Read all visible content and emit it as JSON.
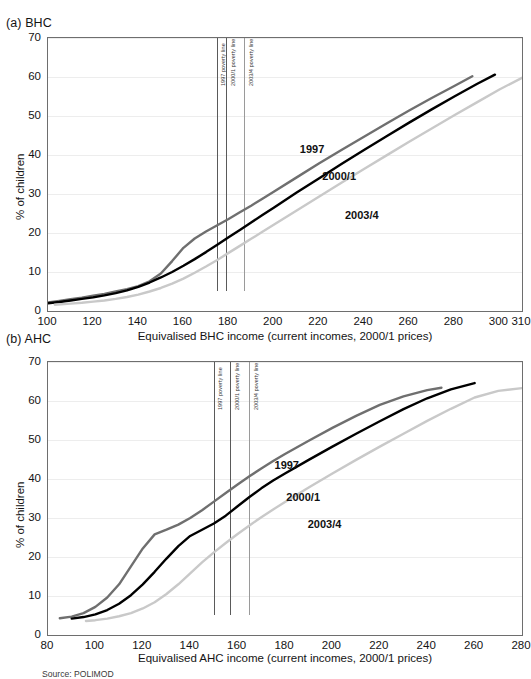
{
  "source_note": "Source: POLIMOD",
  "colors": {
    "s1997": "#6f6f6f",
    "s2000_1": "#000000",
    "s2003_4": "#c9c9c9",
    "frame": "#6e6e6e",
    "grid": "#ededed",
    "poverty_line": "#9a9a9a",
    "poverty_line_strong": "#5a5a5a"
  },
  "panels": [
    {
      "id": "bhc",
      "title": "(a) BHC",
      "chart_data": {
        "type": "line",
        "title": "(a) BHC",
        "xlabel": "Equivalised BHC income (current incomes, 2000/1 prices)",
        "ylabel": "% of children",
        "xlim": [
          100,
          310
        ],
        "ylim": [
          0,
          70
        ],
        "xticks": [
          100,
          120,
          140,
          160,
          180,
          200,
          220,
          240,
          260,
          280,
          300,
          310
        ],
        "yticks": [
          0,
          10,
          20,
          30,
          40,
          50,
          60,
          70
        ],
        "grid": true,
        "legend_position": "inline-annotations",
        "annotations": [
          {
            "text": "1997 poverty line",
            "x": 175,
            "orientation": "vertical"
          },
          {
            "text": "2000/1 poverty line",
            "x": 179,
            "orientation": "vertical"
          },
          {
            "text": "2003/4 poverty line",
            "x": 187,
            "orientation": "vertical"
          }
        ],
        "vlines": [
          175,
          179,
          187
        ],
        "series": [
          {
            "name": "1997",
            "color": "#6f6f6f",
            "label_x": 212,
            "label_y": 41,
            "x": [
              100,
              105,
              110,
              115,
              120,
              125,
              130,
              135,
              140,
              145,
              150,
              155,
              160,
              165,
              170,
              175,
              180,
              185,
              190,
              195,
              200,
              210,
              220,
              230,
              240,
              250,
              260,
              270,
              280,
              288
            ],
            "values": [
              2.2,
              2.6,
              3.0,
              3.4,
              3.9,
              4.4,
              5.0,
              5.6,
              6.4,
              7.6,
              9.6,
              12.8,
              16.2,
              18.6,
              20.4,
              22.0,
              23.6,
              25.3,
              27.0,
              28.8,
              30.6,
              34.2,
              37.8,
              41.3,
              44.7,
              48.1,
              51.4,
              54.6,
              57.7,
              60.2
            ]
          },
          {
            "name": "2000/1",
            "color": "#000000",
            "label_x": 222,
            "label_y": 34,
            "x": [
              100,
              105,
              110,
              115,
              120,
              125,
              130,
              135,
              140,
              145,
              150,
              155,
              160,
              165,
              170,
              175,
              180,
              185,
              190,
              195,
              200,
              210,
              220,
              230,
              240,
              250,
              260,
              270,
              280,
              290,
              298
            ],
            "values": [
              2.0,
              2.3,
              2.7,
              3.1,
              3.5,
              4.0,
              4.6,
              5.3,
              6.2,
              7.3,
              8.6,
              10.0,
              11.6,
              13.3,
              15.1,
              17.0,
              18.9,
              20.8,
              22.7,
              24.6,
              26.5,
              30.3,
              34.0,
              37.7,
              41.3,
              44.8,
              48.3,
              51.7,
              55.0,
              58.2,
              60.6
            ]
          },
          {
            "name": "2003/4",
            "color": "#c9c9c9",
            "label_x": 232,
            "label_y": 24,
            "x": [
              103,
              110,
              115,
              120,
              125,
              130,
              135,
              140,
              145,
              150,
              155,
              160,
              165,
              170,
              175,
              180,
              185,
              190,
              195,
              200,
              210,
              220,
              230,
              240,
              250,
              260,
              270,
              280,
              290,
              300,
              310
            ],
            "values": [
              1.6,
              1.9,
              2.1,
              2.4,
              2.7,
              3.1,
              3.6,
              4.2,
              5.0,
              5.9,
              7.0,
              8.3,
              9.8,
              11.4,
              13.1,
              14.9,
              16.7,
              18.5,
              20.3,
              22.1,
              25.7,
              29.3,
              32.9,
              36.4,
              39.9,
              43.4,
              46.8,
              50.2,
              53.5,
              56.8,
              59.8
            ]
          }
        ]
      }
    },
    {
      "id": "ahc",
      "title": "(b) AHC",
      "chart_data": {
        "type": "line",
        "title": "(b) AHC",
        "xlabel": "Equivalised AHC income (current incomes, 2000/1 prices)",
        "ylabel": "% of children",
        "xlim": [
          80,
          280
        ],
        "ylim": [
          0,
          70
        ],
        "xticks": [
          80,
          100,
          120,
          140,
          160,
          180,
          200,
          220,
          240,
          260,
          280
        ],
        "yticks": [
          0,
          10,
          20,
          30,
          40,
          50,
          60,
          70
        ],
        "grid": true,
        "legend_position": "inline-annotations",
        "annotations": [
          {
            "text": "1997 poverty line",
            "x": 150,
            "orientation": "vertical"
          },
          {
            "text": "2000/1 poverty line",
            "x": 157,
            "orientation": "vertical"
          },
          {
            "text": "2003/4 poverty line",
            "x": 165,
            "orientation": "vertical"
          }
        ],
        "vlines": [
          150,
          157,
          165
        ],
        "series": [
          {
            "name": "1997",
            "color": "#6f6f6f",
            "label_x": 176,
            "label_y": 43,
            "x": [
              85,
              90,
              95,
              100,
              105,
              110,
              115,
              120,
              125,
              130,
              135,
              140,
              145,
              150,
              155,
              160,
              165,
              170,
              175,
              180,
              190,
              200,
              210,
              220,
              230,
              240,
              246
            ],
            "values": [
              4.3,
              4.7,
              5.6,
              7.2,
              9.6,
              13.0,
              17.6,
              22.2,
              25.8,
              27.0,
              28.3,
              30.0,
              32.0,
              34.2,
              36.4,
              38.6,
              40.7,
              42.7,
              44.6,
              46.4,
              49.8,
              53.1,
              56.2,
              59.0,
              61.2,
              62.8,
              63.4
            ]
          },
          {
            "name": "2000/1",
            "color": "#000000",
            "label_x": 181,
            "label_y": 35,
            "x": [
              90,
              95,
              100,
              105,
              110,
              115,
              120,
              125,
              130,
              135,
              140,
              145,
              150,
              155,
              160,
              165,
              170,
              175,
              180,
              190,
              200,
              210,
              220,
              230,
              240,
              250,
              260
            ],
            "values": [
              4.2,
              4.6,
              5.3,
              6.4,
              8.0,
              10.2,
              13.0,
              16.2,
              19.6,
              22.8,
              25.4,
              27.0,
              28.6,
              30.6,
              33.0,
              35.4,
              37.6,
              39.6,
              41.4,
              44.9,
              48.3,
              51.6,
              54.8,
              57.9,
              60.7,
              63.0,
              64.6
            ]
          },
          {
            "name": "2003/4",
            "color": "#c9c9c9",
            "label_x": 190,
            "label_y": 28,
            "x": [
              96,
              100,
              105,
              110,
              115,
              120,
              125,
              130,
              135,
              140,
              145,
              150,
              155,
              160,
              165,
              170,
              175,
              180,
              190,
              200,
              210,
              220,
              230,
              240,
              250,
              260,
              270,
              280
            ],
            "values": [
              3.6,
              3.8,
              4.2,
              4.8,
              5.6,
              6.8,
              8.4,
              10.5,
              13.0,
              15.8,
              18.6,
              21.2,
              23.6,
              25.9,
              28.1,
              30.2,
              32.2,
              34.1,
              37.8,
              41.4,
              44.9,
              48.3,
              51.6,
              54.9,
              58.0,
              60.9,
              62.6,
              63.3
            ]
          }
        ]
      }
    }
  ]
}
